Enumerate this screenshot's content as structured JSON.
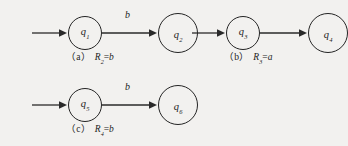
{
  "figure": {
    "kind": "finite-automata-diagram-set",
    "background_color": "#f2f1ef",
    "ink_color": "#242424",
    "panels": [
      {
        "id": "a",
        "caption_tag": "（a）",
        "caption_expr_base": "R",
        "caption_expr_sub": "2",
        "caption_expr_eq": "=",
        "caption_expr_value": "b",
        "start_state": {
          "label_base": "q",
          "label_sub": "1",
          "accepting": false
        },
        "end_state": {
          "label_base": "q",
          "label_sub": "2",
          "accepting": true
        },
        "transition_symbol": "b",
        "has_start_arrow": true
      },
      {
        "id": "b",
        "caption_tag": "（b）",
        "caption_expr_base": "R",
        "caption_expr_sub": "3",
        "caption_expr_eq": "=",
        "caption_expr_value": "a",
        "start_state": {
          "label_base": "q",
          "label_sub": "3",
          "accepting": false
        },
        "end_state": {
          "label_base": "q",
          "label_sub": "4",
          "accepting": true
        },
        "transition_symbol": "",
        "has_start_arrow": true
      },
      {
        "id": "c",
        "caption_tag": "（c）",
        "caption_expr_base": "R",
        "caption_expr_sub": "4",
        "caption_expr_eq": "=",
        "caption_expr_value": "b",
        "start_state": {
          "label_base": "q",
          "label_sub": "5",
          "accepting": false
        },
        "end_state": {
          "label_base": "q",
          "label_sub": "6",
          "accepting": true
        },
        "transition_symbol": "b",
        "has_start_arrow": true
      }
    ]
  }
}
